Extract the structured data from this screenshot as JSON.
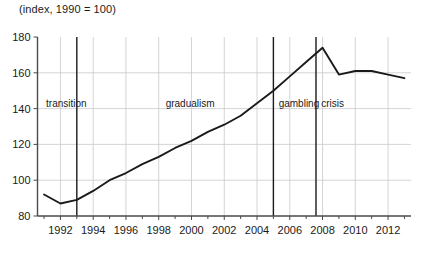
{
  "chart_data": {
    "type": "line",
    "title": "(index, 1990 = 100)",
    "xlabel": "",
    "ylabel": "",
    "xlim": [
      1990.6,
      2013.4
    ],
    "ylim": [
      80,
      180
    ],
    "grid": true,
    "legend": "none",
    "y_ticks": [
      80,
      100,
      120,
      140,
      160,
      180
    ],
    "y_tick_labels": [
      "80",
      "100",
      "120",
      "140",
      "160",
      "180"
    ],
    "x_ticks": [
      1992,
      1994,
      1996,
      1998,
      2000,
      2002,
      2004,
      2006,
      2008,
      2010,
      2012
    ],
    "x_tick_labels": [
      "1992",
      "1994",
      "1996",
      "1998",
      "2000",
      "2002",
      "2004",
      "2006",
      "2008",
      "2010",
      "2012"
    ],
    "x_minor_ticks": [
      1991,
      1993,
      1995,
      1997,
      1999,
      2001,
      2003,
      2005,
      2007,
      2009,
      2011,
      2013
    ],
    "series": [
      {
        "name": "index",
        "x": [
          1991,
          1992,
          1993,
          1994,
          1995,
          1996,
          1997,
          1998,
          1999,
          2000,
          2001,
          2002,
          2003,
          2004,
          2005,
          2006,
          2007,
          2008,
          2009,
          2010,
          2011,
          2012,
          2013
        ],
        "values": [
          92,
          87,
          89,
          94,
          100,
          104,
          109,
          113,
          118,
          122,
          127,
          131,
          136,
          143,
          150,
          158,
          166,
          174,
          159,
          161,
          161,
          159,
          157
        ]
      }
    ],
    "annotations": [
      {
        "label": "transition",
        "x_start": 1990.6,
        "x_end": 1993,
        "text_x": 1991.0,
        "text_y": 141
      },
      {
        "label": "gradualism",
        "x_start": 1993,
        "x_end": 2005,
        "text_x": 1998.3,
        "text_y": 141
      },
      {
        "label": "gambling",
        "x_start": 2005,
        "x_end": 2007.6,
        "text_x": 2005.2,
        "text_y": 141
      },
      {
        "label": "crisis",
        "x_start": 2007.6,
        "x_end": 2013.4,
        "text_x": 2007.8,
        "text_y": 141
      }
    ],
    "dividers": [
      1993,
      2005,
      2007.6
    ],
    "gridlines_y": [
      100,
      120,
      140,
      160
    ],
    "gridlines_x": [
      1992,
      1994,
      1996,
      1998,
      2000,
      2002,
      2004,
      2006,
      2008,
      2010,
      2012
    ],
    "colors": {
      "line": "#1a1a1a",
      "grid": "#c9c9c9",
      "axis": "#4a4a4a",
      "divider": "#1a1a1a",
      "text": "#1a1a1a",
      "background": "#ffffff"
    }
  }
}
